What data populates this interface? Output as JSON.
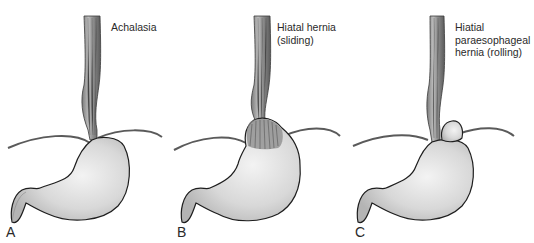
{
  "figure": {
    "panels": [
      {
        "letter": "A",
        "caption": "Achalasia",
        "condition": "achalasia"
      },
      {
        "letter": "B",
        "caption": "Hiatal hernia\n(sliding)",
        "condition": "sliding-hiatal-hernia"
      },
      {
        "letter": "C",
        "caption": "Hiatial\nparaesophageal\nhernia (rolling)",
        "condition": "rolling-paraesophageal-hernia"
      }
    ],
    "colors": {
      "stomach_fill": "#d9d9d9",
      "stomach_highlight": "#f2f2f2",
      "outline": "#1e1e1e",
      "diaphragm": "#555555",
      "esophagus_dark": "#6a6a6a",
      "esophagus_light": "#b5b5b5"
    }
  }
}
